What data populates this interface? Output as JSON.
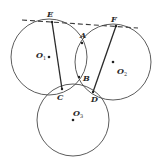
{
  "diagram": {
    "type": "geometry",
    "tangent_line": {
      "style": "dashed",
      "from": [
        22,
        20
      ],
      "to": [
        138,
        28
      ]
    },
    "circles": [
      {
        "name": "O1",
        "label": "O",
        "sub": "1",
        "cx": 49,
        "cy": 57,
        "r": 38,
        "label_x": 36,
        "label_y": 58
      },
      {
        "name": "O2",
        "label": "O",
        "sub": "2",
        "cx": 113,
        "cy": 62,
        "r": 38,
        "label_x": 117,
        "label_y": 74
      },
      {
        "name": "O3",
        "label": "O",
        "sub": "3",
        "cx": 73,
        "cy": 120,
        "r": 36,
        "label_x": 73,
        "label_y": 116
      }
    ],
    "points": {
      "E": {
        "label": "E",
        "x": 52,
        "y": 22,
        "lx": 47,
        "ly": 17
      },
      "F": {
        "label": "F",
        "x": 116,
        "y": 26,
        "lx": 111,
        "ly": 22
      },
      "A": {
        "label": "A",
        "x": 82,
        "y": 43,
        "lx": 80,
        "ly": 38
      },
      "B": {
        "label": "B",
        "x": 79,
        "y": 77,
        "lx": 83,
        "ly": 81
      },
      "C": {
        "label": "C",
        "x": 62,
        "y": 89,
        "lx": 57,
        "ly": 100
      },
      "D": {
        "label": "D",
        "x": 93,
        "y": 92,
        "lx": 91,
        "ly": 102
      }
    },
    "segments": [
      {
        "name": "EC",
        "from": "E",
        "to": "C"
      },
      {
        "name": "FD",
        "from": "F",
        "to": "D"
      }
    ],
    "stroke_color": "#3a3a3a"
  }
}
